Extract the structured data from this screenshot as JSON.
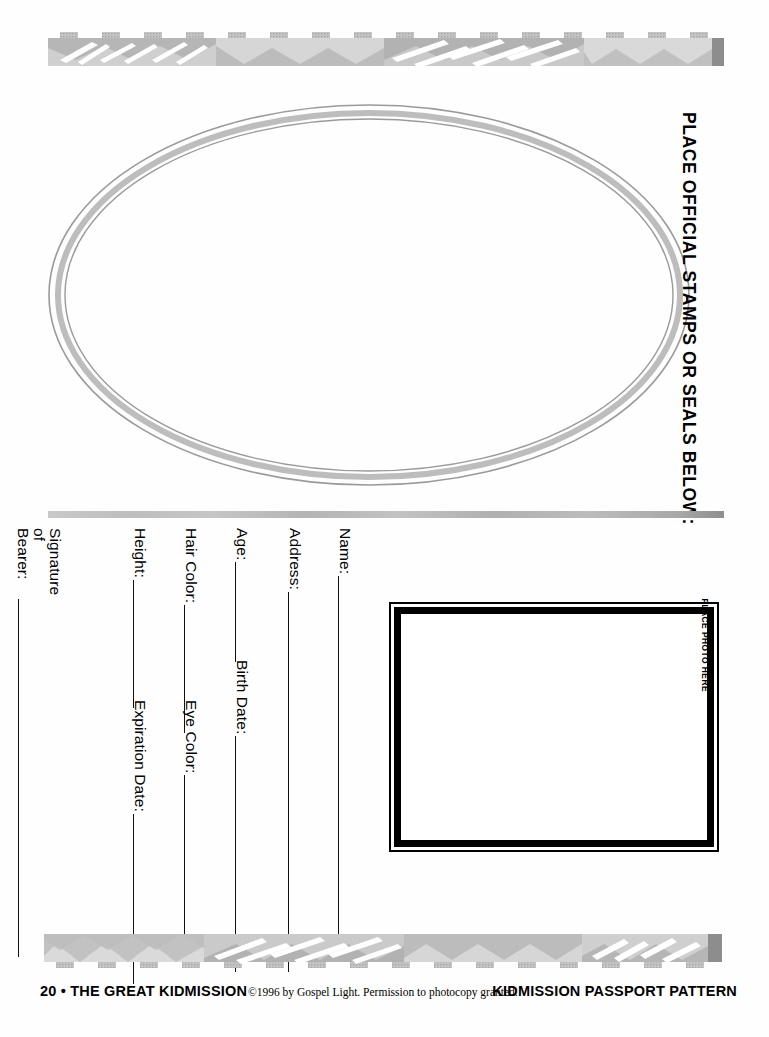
{
  "document": {
    "type": "passport-pattern-worksheet",
    "page_background": "#ffffff"
  },
  "stamps_section": {
    "title": "PLACE OFFICIAL STAMPS OR SEALS BELOW:",
    "oval_name": "stamps-oval"
  },
  "photo_section": {
    "label": "PLACE PHOTO HERE"
  },
  "form": {
    "fields": [
      {
        "label": "Name:",
        "rule_length": 380,
        "column": 0
      },
      {
        "label": "Address:",
        "rule_length": 380,
        "column": 1
      },
      {
        "label": "Age:",
        "rule_length": 100,
        "column": 2
      },
      {
        "label": "Birth Date:",
        "rule_length": 236,
        "column": 2
      },
      {
        "label": "Hair Color:",
        "rule_length": 128,
        "column": 3
      },
      {
        "label": "Eye Color:",
        "rule_length": 178,
        "column": 3
      },
      {
        "label": "Height:",
        "rule_length": 128,
        "column": 4
      },
      {
        "label": "Expiration Date:",
        "rule_length": 170,
        "column": 4
      },
      {
        "label": "Signature\nof Bearer:",
        "rule_length": 360,
        "column": 5
      }
    ]
  },
  "footer": {
    "left": "20 • THE GREAT KIDMISSION",
    "center": "©1996 by Gospel Light. Permission to photocopy granted.",
    "right": "KIDMISSION PASSPORT PATTERN"
  },
  "decoration": {
    "top_band": "tribal-pattern-band",
    "bottom_band": "tribal-pattern-band",
    "divider": "gradient-rule",
    "colors": {
      "gray_light": "#d2d2d2",
      "gray_mid": "#b5b5b5",
      "gray_dark": "#8f8f8f",
      "ink": "#000000"
    }
  }
}
